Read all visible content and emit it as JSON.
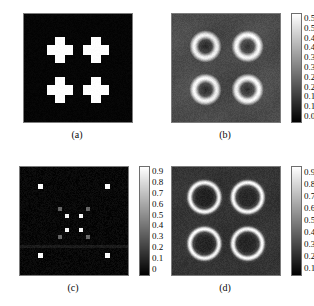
{
  "figure": {
    "background": "#ffffff",
    "panels": [
      {
        "id": "a",
        "label": "(a)",
        "kind": "phantom-crosses",
        "x": 23,
        "y": 13,
        "w": 108,
        "h": 108,
        "has_colorbar": false,
        "description": "Binary phantom: four white cross/plus shaped inclusions on black background"
      },
      {
        "id": "b",
        "label": "(b)",
        "kind": "reconstruction-rings",
        "x": 171,
        "y": 13,
        "w": 108,
        "h": 108,
        "has_colorbar": true,
        "description": "Reconstruction showing four bright rings with dark cores on gray background"
      },
      {
        "id": "c",
        "label": "(c)",
        "kind": "sparse-dots",
        "x": 19,
        "y": 166,
        "w": 108,
        "h": 108,
        "has_colorbar": true,
        "description": "Sparse dark field with four white corner dots and a central cluster of bright and gray squares"
      },
      {
        "id": "d",
        "label": "(d)",
        "kind": "reconstruction-rings-sharp",
        "x": 171,
        "y": 166,
        "w": 108,
        "h": 108,
        "has_colorbar": true,
        "description": "Reconstruction showing four sharp thin bright rings on dark gray background"
      }
    ]
  },
  "chart_data": [
    {
      "panel": "a",
      "type": "heatmap",
      "title": "(a)",
      "colorbar": null,
      "value_range": [
        0,
        1
      ],
      "background_value": 0.02,
      "objects": [
        {
          "shape": "cross",
          "cx": 0.33,
          "cy": 0.33,
          "radius": 0.115,
          "value": 1.0
        },
        {
          "shape": "cross",
          "cx": 0.67,
          "cy": 0.33,
          "radius": 0.115,
          "value": 1.0
        },
        {
          "shape": "cross",
          "cx": 0.33,
          "cy": 0.7,
          "radius": 0.115,
          "value": 1.0
        },
        {
          "shape": "cross",
          "cx": 0.67,
          "cy": 0.7,
          "radius": 0.115,
          "value": 1.0
        }
      ]
    },
    {
      "panel": "b",
      "type": "heatmap",
      "title": "(b)",
      "colorbar": {
        "ticks": [
          "0.55",
          "0.5",
          "0.45",
          "0.4",
          "0.35",
          "0.3",
          "0.25",
          "0.2",
          "0.15",
          "0.1",
          "0.05"
        ],
        "min": 0.05,
        "max": 0.55,
        "step": 0.05,
        "orientation": "vertical",
        "cmap": "gray"
      },
      "value_range": [
        0.0,
        0.58
      ],
      "background_value": 0.17,
      "objects": [
        {
          "shape": "ring",
          "cx": 0.31,
          "cy": 0.3,
          "r": 0.105,
          "thickness": 0.042,
          "peak": 0.56,
          "core": 0.09,
          "glow": 0.075
        },
        {
          "shape": "ring",
          "cx": 0.7,
          "cy": 0.3,
          "r": 0.105,
          "thickness": 0.042,
          "peak": 0.56,
          "core": 0.09,
          "glow": 0.075
        },
        {
          "shape": "ring",
          "cx": 0.31,
          "cy": 0.7,
          "r": 0.105,
          "thickness": 0.042,
          "peak": 0.56,
          "core": 0.09,
          "glow": 0.075
        },
        {
          "shape": "ring",
          "cx": 0.7,
          "cy": 0.7,
          "r": 0.105,
          "thickness": 0.042,
          "peak": 0.56,
          "core": 0.09,
          "glow": 0.075
        }
      ]
    },
    {
      "panel": "c",
      "type": "heatmap",
      "title": "(c)",
      "colorbar": {
        "ticks": [
          "0.9",
          "0.8",
          "0.7",
          "0.6",
          "0.5",
          "0.4",
          "0.3",
          "0.2",
          "0.1",
          "0"
        ],
        "min": 0.0,
        "max": 0.95,
        "step": 0.1,
        "orientation": "vertical",
        "cmap": "gray"
      },
      "value_range": [
        0.0,
        0.95
      ],
      "background_value": 0.03,
      "objects": [
        {
          "shape": "square",
          "cx": 0.19,
          "cy": 0.18,
          "size": 0.042,
          "value": 0.95
        },
        {
          "shape": "square",
          "cx": 0.81,
          "cy": 0.18,
          "size": 0.042,
          "value": 0.95
        },
        {
          "shape": "square",
          "cx": 0.19,
          "cy": 0.82,
          "size": 0.042,
          "value": 0.95
        },
        {
          "shape": "square",
          "cx": 0.81,
          "cy": 0.82,
          "size": 0.042,
          "value": 0.95
        },
        {
          "shape": "square",
          "cx": 0.435,
          "cy": 0.455,
          "size": 0.042,
          "value": 0.92
        },
        {
          "shape": "square",
          "cx": 0.565,
          "cy": 0.455,
          "size": 0.042,
          "value": 0.92
        },
        {
          "shape": "square",
          "cx": 0.435,
          "cy": 0.585,
          "size": 0.042,
          "value": 0.92
        },
        {
          "shape": "square",
          "cx": 0.565,
          "cy": 0.585,
          "size": 0.042,
          "value": 0.92
        },
        {
          "shape": "square",
          "cx": 0.37,
          "cy": 0.39,
          "size": 0.04,
          "value": 0.38
        },
        {
          "shape": "square",
          "cx": 0.63,
          "cy": 0.39,
          "size": 0.04,
          "value": 0.38
        },
        {
          "shape": "square",
          "cx": 0.37,
          "cy": 0.65,
          "size": 0.04,
          "value": 0.38
        },
        {
          "shape": "square",
          "cx": 0.63,
          "cy": 0.65,
          "size": 0.04,
          "value": 0.38
        }
      ],
      "artifacts": [
        {
          "shape": "hband",
          "cy": 0.735,
          "thickness": 0.012,
          "value": 0.1
        }
      ]
    },
    {
      "panel": "d",
      "type": "heatmap",
      "title": "(d)",
      "colorbar": {
        "ticks": [
          "0.9",
          "0.8",
          "0.7",
          "0.6",
          "0.5",
          "0.4",
          "0.3",
          "0.2",
          "0.1"
        ],
        "min": 0.1,
        "max": 0.9,
        "step": 0.1,
        "orientation": "vertical",
        "cmap": "gray"
      },
      "value_range": [
        0.0,
        0.98
      ],
      "background_value": 0.2,
      "objects": [
        {
          "shape": "ring",
          "cx": 0.3,
          "cy": 0.28,
          "r": 0.135,
          "thickness": 0.028,
          "peak": 0.96,
          "core": 0.14,
          "glow": 0.035
        },
        {
          "shape": "ring",
          "cx": 0.7,
          "cy": 0.28,
          "r": 0.135,
          "thickness": 0.028,
          "peak": 0.96,
          "core": 0.14,
          "glow": 0.035
        },
        {
          "shape": "ring",
          "cx": 0.3,
          "cy": 0.71,
          "r": 0.135,
          "thickness": 0.028,
          "peak": 0.96,
          "core": 0.14,
          "glow": 0.035
        },
        {
          "shape": "ring",
          "cx": 0.7,
          "cy": 0.71,
          "r": 0.135,
          "thickness": 0.028,
          "peak": 0.96,
          "core": 0.14,
          "glow": 0.035
        }
      ]
    }
  ]
}
